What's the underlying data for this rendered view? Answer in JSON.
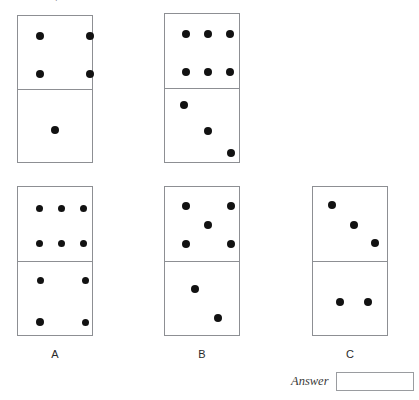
{
  "page": {
    "top_clipped_text": "sequence of dominoes",
    "pip_color": "#121212",
    "border_color": "#8d8f93"
  },
  "sequence": {
    "name": "domino-sequence-row",
    "dominoes": [
      {
        "id": "sequence-domino-1",
        "top_value": 4,
        "bottom_value": 1,
        "top_pips": [
          {
            "x": 22,
            "y": 20
          },
          {
            "x": 72,
            "y": 20
          },
          {
            "x": 22,
            "y": 58
          },
          {
            "x": 72,
            "y": 58
          }
        ],
        "bottom_pips": [
          {
            "x": 37,
            "y": 40
          }
        ]
      },
      {
        "id": "sequence-domino-2",
        "top_value": 6,
        "bottom_value": 3,
        "top_pips": [
          {
            "x": 21,
            "y": 20
          },
          {
            "x": 43,
            "y": 20
          },
          {
            "x": 65,
            "y": 20
          },
          {
            "x": 21,
            "y": 58
          },
          {
            "x": 43,
            "y": 58
          },
          {
            "x": 65,
            "y": 58
          }
        ],
        "bottom_pips": [
          {
            "x": 19,
            "y": 16
          },
          {
            "x": 43,
            "y": 42
          },
          {
            "x": 66,
            "y": 64
          }
        ]
      }
    ]
  },
  "options": {
    "name": "answer-options-row",
    "items": [
      {
        "label": "A",
        "id": "option-domino-a",
        "top_value": 6,
        "bottom_value": 4,
        "top_pips": [
          {
            "x": 21,
            "y": 21
          },
          {
            "x": 43,
            "y": 21
          },
          {
            "x": 65,
            "y": 21
          },
          {
            "x": 21,
            "y": 56
          },
          {
            "x": 43,
            "y": 56
          },
          {
            "x": 65,
            "y": 56
          }
        ],
        "bottom_pips": [
          {
            "x": 22,
            "y": 18
          },
          {
            "x": 67,
            "y": 18
          },
          {
            "x": 22,
            "y": 60
          },
          {
            "x": 67,
            "y": 60
          }
        ]
      },
      {
        "label": "B",
        "id": "option-domino-b",
        "top_value": 5,
        "bottom_value": 2,
        "top_pips": [
          {
            "x": 21,
            "y": 19
          },
          {
            "x": 66,
            "y": 19
          },
          {
            "x": 43,
            "y": 38
          },
          {
            "x": 21,
            "y": 57
          },
          {
            "x": 66,
            "y": 57
          }
        ],
        "bottom_pips": [
          {
            "x": 30,
            "y": 27
          },
          {
            "x": 53,
            "y": 56
          }
        ]
      },
      {
        "label": "C",
        "id": "option-domino-c",
        "top_value": 3,
        "bottom_value": 2,
        "top_pips": [
          {
            "x": 19,
            "y": 18
          },
          {
            "x": 41,
            "y": 38
          },
          {
            "x": 62,
            "y": 56
          }
        ],
        "bottom_pips": [
          {
            "x": 27,
            "y": 40
          },
          {
            "x": 55,
            "y": 40
          }
        ]
      }
    ]
  },
  "answer": {
    "label": "Answer",
    "value": "",
    "placeholder": ""
  }
}
